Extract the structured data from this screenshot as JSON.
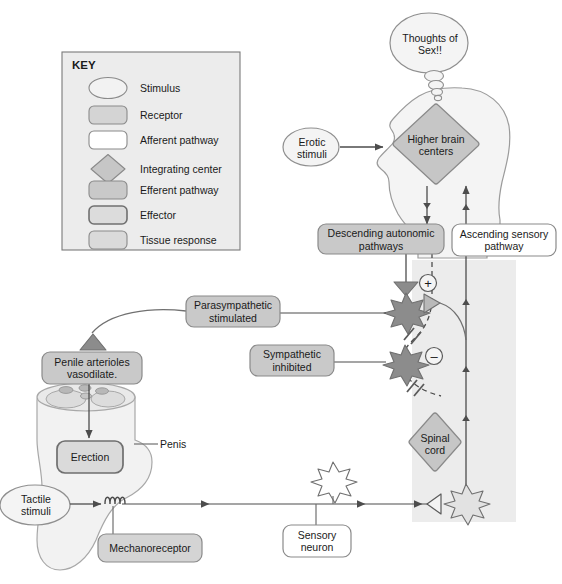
{
  "diagram": {
    "colors": {
      "stimulus_fill": "#f2f2f2",
      "receptor_fill": "#d4d4d4",
      "afferent_fill": "#ffffff",
      "integrating_fill": "#c6c6c6",
      "efferent_fill": "#c9c9c9",
      "effector_fill": "#dcdcdc",
      "tissue_fill": "#dadada",
      "panel_fill": "#ececec",
      "neuron_dark": "#8c8c8c",
      "neuron_light": "#e2e2e2",
      "stroke": "#6b6b6b",
      "line": "#4d4d4d"
    }
  },
  "key": {
    "title": "KEY",
    "items": [
      {
        "label": "Stimulus",
        "shape": "oval",
        "fill": "#f2f2f2"
      },
      {
        "label": "Receptor",
        "shape": "rounded",
        "fill": "#d4d4d4"
      },
      {
        "label": "Afferent pathway",
        "shape": "rounded",
        "fill": "#ffffff"
      },
      {
        "label": "Integrating center",
        "shape": "diamond",
        "fill": "#c6c6c6"
      },
      {
        "label": "Efferent pathway",
        "shape": "rounded",
        "fill": "#c9c9c9"
      },
      {
        "label": "Effector",
        "shape": "rounded",
        "fill": "#dcdcdc"
      },
      {
        "label": "Tissue response",
        "shape": "rounded",
        "fill": "#dadada"
      }
    ]
  },
  "nodes": {
    "thought_bubble": "Thoughts of Sex!!",
    "erotic_stimuli": "Erotic stimuli",
    "higher_brain_centers": "Higher brain centers",
    "descending_autonomic_pathways": "Descending autonomic pathways",
    "ascending_sensory_pathway": "Ascending sensory pathway",
    "parasympathetic_stimulated": "Parasympathetic stimulated",
    "sympathetic_inhibited": "Sympathetic inhibited",
    "spinal_cord": "Spinal cord",
    "penile_arterioles": "Penile arterioles vasodilate.",
    "erection": "Erection",
    "penis_label": "Penis",
    "tactile_stimuli": "Tactile stimuli",
    "mechanoreceptor": "Mechanoreceptor",
    "sensory_neuron": "Sensory neuron"
  },
  "symbols": {
    "excitatory": "+",
    "inhibitory": "–"
  }
}
